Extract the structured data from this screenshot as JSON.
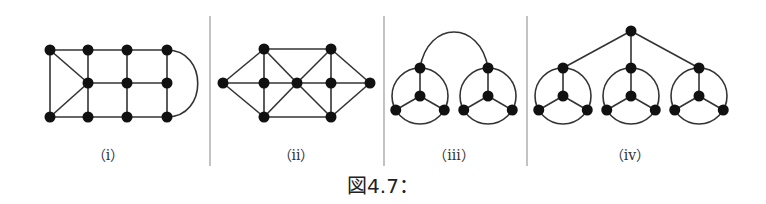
{
  "figure": {
    "caption": "図4.7：",
    "colors": {
      "node": "#111111",
      "edge": "#333333",
      "divider": "#9a9a9a",
      "text": "#333333"
    },
    "panels": [
      {
        "id": "i",
        "label": "（i）"
      },
      {
        "id": "ii",
        "label": "（ii）"
      },
      {
        "id": "iii",
        "label": "（iii）"
      },
      {
        "id": "iv",
        "label": "（iv）"
      }
    ],
    "graphs": {
      "i": {
        "nodes": [
          [
            50,
            50
          ],
          [
            88,
            50
          ],
          [
            127,
            50
          ],
          [
            167,
            50
          ],
          [
            88,
            83
          ],
          [
            127,
            83
          ],
          [
            167,
            83
          ],
          [
            50,
            117
          ],
          [
            88,
            117
          ],
          [
            127,
            117
          ],
          [
            167,
            117
          ]
        ],
        "edges": [
          [
            0,
            1
          ],
          [
            1,
            2
          ],
          [
            2,
            3
          ],
          [
            0,
            7
          ],
          [
            0,
            4
          ],
          [
            7,
            4
          ],
          [
            1,
            4
          ],
          [
            4,
            8
          ],
          [
            2,
            5
          ],
          [
            5,
            9
          ],
          [
            3,
            6
          ],
          [
            6,
            10
          ],
          [
            4,
            5
          ],
          [
            5,
            6
          ],
          [
            7,
            8
          ],
          [
            8,
            9
          ],
          [
            9,
            10
          ]
        ],
        "arcs": [
          {
            "from": 3,
            "to": 10,
            "path": "M167,50 C208,50 208,117 167,117"
          }
        ]
      },
      "ii": {
        "nodes": [
          [
            223,
            83
          ],
          [
            264,
            49
          ],
          [
            264,
            83
          ],
          [
            264,
            117
          ],
          [
            297,
            83
          ],
          [
            331,
            49
          ],
          [
            331,
            83
          ],
          [
            331,
            117
          ],
          [
            370,
            83
          ]
        ],
        "edges": [
          [
            0,
            1
          ],
          [
            0,
            2
          ],
          [
            0,
            3
          ],
          [
            1,
            2
          ],
          [
            2,
            3
          ],
          [
            1,
            4
          ],
          [
            2,
            4
          ],
          [
            3,
            4
          ],
          [
            1,
            5
          ],
          [
            3,
            7
          ],
          [
            4,
            5
          ],
          [
            4,
            6
          ],
          [
            4,
            7
          ],
          [
            5,
            6
          ],
          [
            6,
            7
          ],
          [
            5,
            8
          ],
          [
            6,
            8
          ],
          [
            7,
            8
          ]
        ]
      },
      "iii": {
        "wheels": [
          {
            "cx": 420,
            "cy": 96,
            "r": 28
          },
          {
            "cx": 488,
            "cy": 96,
            "r": 28
          }
        ],
        "bridge": "M420,68 C428,20 480,20 488,68"
      },
      "iv": {
        "top": [
          631,
          31
        ],
        "wheels": [
          {
            "cx": 563,
            "cy": 96,
            "r": 28
          },
          {
            "cx": 631,
            "cy": 96,
            "r": 28
          },
          {
            "cx": 699,
            "cy": 96,
            "r": 28
          }
        ]
      }
    }
  }
}
